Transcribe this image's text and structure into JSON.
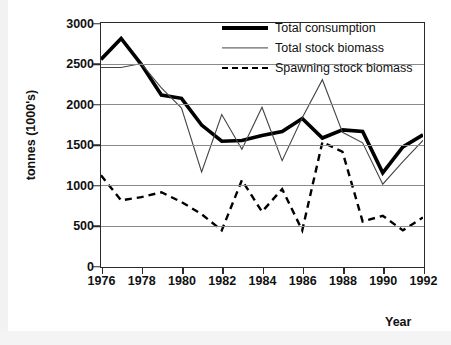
{
  "chart_data": {
    "type": "line",
    "title": "",
    "xlabel": "Year",
    "ylabel": "tonnes (1000's)",
    "xlim": [
      1976,
      1992
    ],
    "ylim": [
      0,
      3000
    ],
    "ytick_labels": [
      "3000",
      "2500",
      "2000",
      "1500",
      "1000",
      "500",
      "0"
    ],
    "ytick_values": [
      3000,
      2500,
      2000,
      1500,
      1000,
      500,
      0
    ],
    "xtick_labels": [
      "1976",
      "1978",
      "1980",
      "1982",
      "1984",
      "1986",
      "1988",
      "1990",
      "1992"
    ],
    "xtick_values": [
      1976,
      1978,
      1980,
      1982,
      1984,
      1986,
      1988,
      1990,
      1992
    ],
    "grid": "horizontal",
    "legend_position": "top-right",
    "x": [
      1976,
      1977,
      1978,
      1979,
      1980,
      1981,
      1982,
      1983,
      1984,
      1985,
      1986,
      1987,
      1988,
      1989,
      1990,
      1991,
      1992
    ],
    "series": [
      {
        "name": "Total consumption",
        "style": "solid-thick",
        "color": "#000000",
        "values": [
          2550,
          2810,
          2490,
          2110,
          2070,
          1740,
          1540,
          1550,
          1610,
          1660,
          1820,
          1580,
          1680,
          1660,
          1150,
          1470,
          1620
        ]
      },
      {
        "name": "Total stock biomass",
        "style": "solid-thin",
        "color": "#444444",
        "values": [
          2450,
          2450,
          2500,
          2200,
          1950,
          1160,
          1870,
          1440,
          1960,
          1300,
          1830,
          2300,
          1650,
          1520,
          1010,
          1290,
          1550
        ]
      },
      {
        "name": "Spawning stock biomass",
        "style": "dashed",
        "color": "#000000",
        "values": [
          1120,
          810,
          850,
          910,
          790,
          640,
          440,
          1060,
          670,
          950,
          440,
          1530,
          1410,
          550,
          620,
          440,
          600
        ]
      }
    ]
  },
  "legend": {
    "items": [
      {
        "label": "Total consumption",
        "swatch": "thick-line-swatch"
      },
      {
        "label": "Total stock biomass",
        "swatch": "thin-line-swatch"
      },
      {
        "label": "Spawning stock biomass",
        "swatch": "dashed-line-swatch"
      }
    ]
  },
  "axes": {
    "y_title": "tonnes (1000's)",
    "x_title": "Year"
  }
}
